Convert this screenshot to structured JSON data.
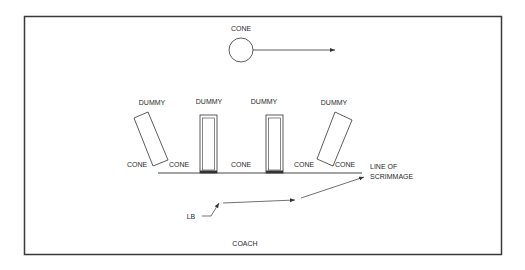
{
  "diagram": {
    "type": "football-drill",
    "colors": {
      "line": "#333333",
      "text": "#2a2a2a",
      "background": "#ffffff",
      "border": "#3a3a3a"
    },
    "top_cone": {
      "label": "CONE"
    },
    "dummies": [
      {
        "label": "DUMMY",
        "orientation": "tilted-left"
      },
      {
        "label": "DUMMY",
        "orientation": "upright"
      },
      {
        "label": "DUMMY",
        "orientation": "upright"
      },
      {
        "label": "DUMMY",
        "orientation": "tilted-right"
      }
    ],
    "cones": [
      "CONE",
      "CONE",
      "CONE",
      "CONE",
      "CONE"
    ],
    "line_of_scrimmage": {
      "line1": "LINE OF",
      "line2": "SCRIMMAGE"
    },
    "linebacker": {
      "label": "LB"
    },
    "coach": {
      "label": "COACH"
    }
  }
}
